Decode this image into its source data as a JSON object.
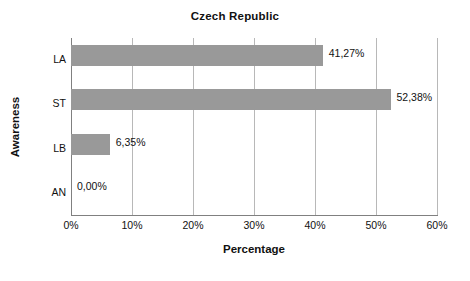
{
  "chart_data": {
    "type": "bar",
    "orientation": "horizontal",
    "title": "Czech Republic",
    "xlabel": "Percentage",
    "ylabel": "Awareness",
    "categories": [
      "LA",
      "ST",
      "LB",
      "AN"
    ],
    "values": [
      41.27,
      52.38,
      6.35,
      0.0
    ],
    "data_labels": [
      "41,27%",
      "52,38%",
      "6,35%",
      "0,00%"
    ],
    "xlim": [
      0,
      60
    ],
    "xtick_values": [
      0,
      10,
      20,
      30,
      40,
      50,
      60
    ],
    "xtick_labels": [
      "0%",
      "10%",
      "20%",
      "30%",
      "40%",
      "50%",
      "60%"
    ],
    "grid": "vertical",
    "legend": "none",
    "bar_color": "#999999",
    "gridline_color": "#b8b8b8",
    "axis_color": "#808080",
    "text_color": "#111111",
    "background_color": "#ffffff"
  }
}
